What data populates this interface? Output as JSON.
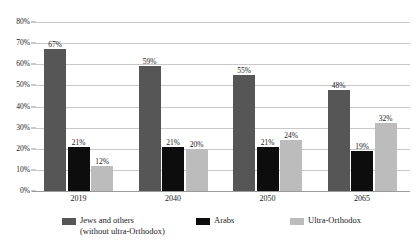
{
  "chart_data": {
    "type": "bar",
    "title": "",
    "xlabel": "",
    "ylabel": "",
    "ylim": [
      0,
      80
    ],
    "ytick_labels": [
      "0%",
      "10%",
      "20%",
      "30%",
      "40%",
      "50%",
      "60%",
      "70%",
      "80%"
    ],
    "ytick_values": [
      0,
      10,
      20,
      30,
      40,
      50,
      60,
      70,
      80
    ],
    "grid": true,
    "legend_position": "bottom",
    "categories": [
      "2019",
      "2040",
      "2050",
      "2065"
    ],
    "series": [
      {
        "name": "Jews and others\n(without ultra-Orthodox)",
        "color": "#565656",
        "values": [
          67,
          59,
          55,
          48
        ],
        "labels": [
          "67%",
          "59%",
          "55%",
          "48%"
        ]
      },
      {
        "name": "Arabs",
        "color": "#0d0d0d",
        "values": [
          21,
          21,
          21,
          19
        ],
        "labels": [
          "21%",
          "21%",
          "21%",
          "19%"
        ]
      },
      {
        "name": "Ultra-Orthodox",
        "color": "#bcbcbc",
        "values": [
          12,
          20,
          24,
          32
        ],
        "labels": [
          "12%",
          "20%",
          "24%",
          "32%"
        ]
      }
    ]
  }
}
